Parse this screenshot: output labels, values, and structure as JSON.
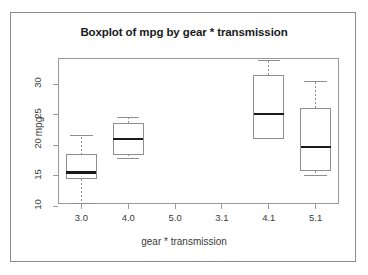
{
  "chart_data": {
    "type": "boxplot",
    "title": "Boxplot of mpg by gear * transmission",
    "xlabel": "gear * transmission",
    "ylabel": "mpg",
    "grid": false,
    "legend": "none",
    "ylim": [
      9.0,
      34.5
    ],
    "yticks": [
      10,
      15,
      20,
      25,
      30
    ],
    "ytick_labels": [
      "10",
      "15",
      "20",
      "25",
      "30"
    ],
    "categories": [
      "3.0",
      "4.0",
      "5.0",
      "3.1",
      "4.1",
      "5.1"
    ],
    "boxes": [
      {
        "category": "3.0",
        "empty": false,
        "lower_whisker": 10.4,
        "q1": 14.5,
        "median": 15.5,
        "q3": 18.4,
        "upper_whisker": 21.5
      },
      {
        "category": "4.0",
        "empty": false,
        "lower_whisker": 17.8,
        "q1": 18.5,
        "median": 21.0,
        "q3": 23.6,
        "upper_whisker": 24.5
      },
      {
        "category": "5.0",
        "empty": true,
        "lower_whisker": null,
        "q1": null,
        "median": null,
        "q3": null,
        "upper_whisker": null
      },
      {
        "category": "3.1",
        "empty": true,
        "lower_whisker": null,
        "q1": null,
        "median": null,
        "q3": null,
        "upper_whisker": null
      },
      {
        "category": "4.1",
        "empty": false,
        "lower_whisker": 21.0,
        "q1": 21.0,
        "median": 25.1,
        "q3": 31.4,
        "upper_whisker": 33.9
      },
      {
        "category": "5.1",
        "empty": false,
        "lower_whisker": 15.0,
        "q1": 15.8,
        "median": 19.7,
        "q3": 26.0,
        "upper_whisker": 30.4
      }
    ],
    "colors": {
      "box_stroke": "#8f8f8f",
      "median_stroke": "#1a1a1a",
      "whisker_stroke": "#8f8f8f",
      "axis_stroke": "#9a9a9a",
      "text": "#3a3a3a",
      "title_text": "#1a1a1a",
      "background": "#ffffff"
    }
  }
}
